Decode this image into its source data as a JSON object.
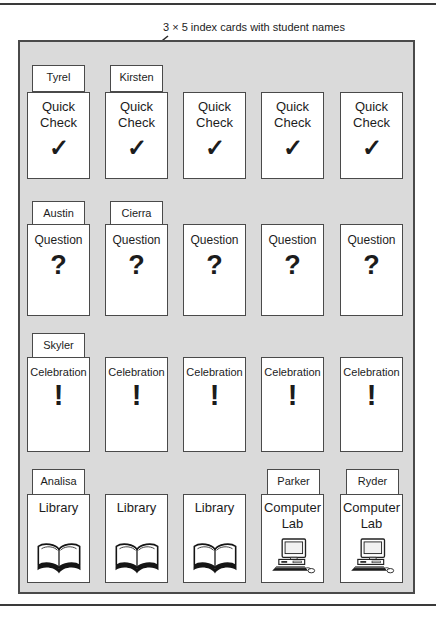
{
  "colors": {
    "board_bg": "#dadada",
    "card_bg": "#ffffff",
    "line": "#4a4a4a",
    "text": "#1c1c1c"
  },
  "annotations": {
    "index_cards": "3 × 5 index cards with student names",
    "pockets": "library paper pockets"
  },
  "board": {
    "rows": [
      {
        "type": "quick-check",
        "pockets": [
          {
            "tag": "Tyrel",
            "label": "Quick Check",
            "symbol": "✓"
          },
          {
            "tag": "Kirsten",
            "label": "Quick Check",
            "symbol": "✓"
          },
          {
            "label": "Quick Check",
            "symbol": "✓"
          },
          {
            "label": "Quick Check",
            "symbol": "✓"
          },
          {
            "label": "Quick Check",
            "symbol": "✓"
          }
        ]
      },
      {
        "type": "question",
        "pockets": [
          {
            "tag": "Austin",
            "label": "Question",
            "symbol": "?"
          },
          {
            "tag": "Cierra",
            "label": "Question",
            "symbol": "?"
          },
          {
            "label": "Question",
            "symbol": "?"
          },
          {
            "label": "Question",
            "symbol": "?"
          },
          {
            "label": "Question",
            "symbol": "?"
          }
        ]
      },
      {
        "type": "celebration",
        "pockets": [
          {
            "tag": "Skyler",
            "label": "Celebration",
            "symbol": "!"
          },
          {
            "label": "Celebration",
            "symbol": "!"
          },
          {
            "label": "Celebration",
            "symbol": "!"
          },
          {
            "label": "Celebration",
            "symbol": "!"
          },
          {
            "label": "Celebration",
            "symbol": "!"
          }
        ]
      },
      {
        "type": "destination",
        "pockets": [
          {
            "tag": "Analisa",
            "label": "Library",
            "icon": "open-book"
          },
          {
            "label": "Library",
            "icon": "open-book"
          },
          {
            "label": "Library",
            "icon": "open-book"
          },
          {
            "tag": "Parker",
            "label": "Computer Lab",
            "icon": "computer"
          },
          {
            "tag": "Ryder",
            "label": "Computer Lab",
            "icon": "computer"
          }
        ]
      }
    ]
  }
}
